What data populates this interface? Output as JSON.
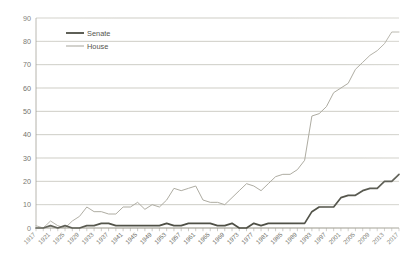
{
  "chart_data": {
    "type": "line",
    "title": "",
    "subtitle": "",
    "xlabel": "",
    "ylabel": "",
    "ylim": [
      0,
      90
    ],
    "ytick_values": [
      0,
      10,
      20,
      30,
      40,
      50,
      60,
      70,
      80,
      90
    ],
    "ytick_labels": [
      "0",
      "10",
      "20",
      "30",
      "40",
      "50",
      "60",
      "70",
      "80",
      "90"
    ],
    "grid": true,
    "legend_position": "top-left-inside",
    "xlim": [
      1917,
      2017
    ],
    "xtick_labels": [
      "1917",
      "1921",
      "1925",
      "1929",
      "1933",
      "1937",
      "1941",
      "1945",
      "1949",
      "1953",
      "1957",
      "1961",
      "1965",
      "1969",
      "1973",
      "1977",
      "1981",
      "1985",
      "1989",
      "1993",
      "1997",
      "2001",
      "2005",
      "2009",
      "2013",
      "2017"
    ],
    "x": [
      1917,
      1919,
      1921,
      1923,
      1925,
      1927,
      1929,
      1931,
      1933,
      1935,
      1937,
      1939,
      1941,
      1943,
      1945,
      1947,
      1949,
      1951,
      1953,
      1955,
      1957,
      1959,
      1961,
      1963,
      1965,
      1967,
      1969,
      1971,
      1973,
      1975,
      1977,
      1979,
      1981,
      1983,
      1985,
      1987,
      1989,
      1991,
      1993,
      1995,
      1997,
      1999,
      2001,
      2003,
      2005,
      2007,
      2009,
      2011,
      2013,
      2015,
      2017
    ],
    "series": [
      {
        "name": "Senate",
        "color": "#4f5046",
        "values": [
          0,
          0,
          1,
          0,
          1,
          0,
          0,
          1,
          1,
          2,
          2,
          1,
          1,
          1,
          1,
          1,
          1,
          1,
          2,
          1,
          1,
          2,
          2,
          2,
          2,
          1,
          1,
          2,
          0,
          0,
          2,
          1,
          2,
          2,
          2,
          2,
          2,
          2,
          7,
          9,
          9,
          9,
          13,
          14,
          14,
          16,
          17,
          17,
          20,
          20,
          23
        ]
      },
      {
        "name": "House",
        "color": "#aeaca2",
        "values": [
          1,
          0,
          3,
          1,
          0,
          3,
          5,
          9,
          7,
          7,
          6,
          6,
          9,
          9,
          11,
          8,
          10,
          9,
          12,
          17,
          16,
          17,
          18,
          12,
          11,
          11,
          10,
          13,
          16,
          19,
          18,
          16,
          19,
          22,
          23,
          23,
          25,
          29,
          48,
          49,
          52,
          58,
          60,
          62,
          68,
          71,
          74,
          76,
          79,
          84,
          84
        ]
      }
    ],
    "legend": [
      {
        "label": "Senate",
        "color": "#4f5046"
      },
      {
        "label": "House",
        "color": "#aeaca2"
      }
    ]
  }
}
